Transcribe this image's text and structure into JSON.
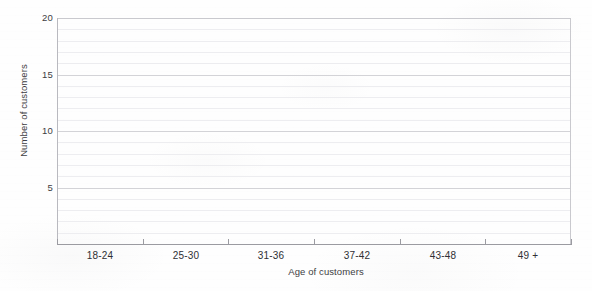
{
  "chart_data": {
    "type": "bar",
    "title": "",
    "subtitle": "",
    "xlabel": "Age of customers",
    "ylabel": "Number of customers",
    "categories": [
      "18-24",
      "25-30",
      "31-36",
      "37-42",
      "43-48",
      "49 +"
    ],
    "values": [
      0,
      0,
      0,
      0,
      0,
      0
    ],
    "series": [
      {
        "name": "Number of customers",
        "values": [
          0,
          0,
          0,
          0,
          0,
          0
        ]
      }
    ],
    "ylim": [
      0,
      20
    ],
    "xlim": [
      0,
      6
    ],
    "y_ticks": [
      5,
      10,
      15,
      20
    ],
    "y_tick_labels": [
      "5",
      "10",
      "15",
      "20"
    ],
    "y_minor_tick_step": 1,
    "x_tick_labels": [
      "18-24",
      "25-30",
      "31-36",
      "37-42",
      "43-48",
      "49 +"
    ],
    "grid": "horizontal",
    "legend": "none",
    "annotations": []
  },
  "axes": {
    "y": {
      "title": "Number of customers",
      "ticks": [
        {
          "label": "20",
          "value": 20
        },
        {
          "label": "15",
          "value": 15
        },
        {
          "label": "10",
          "value": 10
        },
        {
          "label": "5",
          "value": 5
        }
      ]
    },
    "x": {
      "title": "Age of customers",
      "ticks": [
        {
          "label": "18-24"
        },
        {
          "label": "25-30"
        },
        {
          "label": "31-36"
        },
        {
          "label": "37-42"
        },
        {
          "label": "43-48"
        },
        {
          "label": "49 +"
        }
      ]
    }
  },
  "colors": {
    "background": "#fefefe",
    "gridline_minor": "#ededf0",
    "gridline_major": "#d3d3d7",
    "axis_line": "#9b9ba1",
    "text": "#2f2f34",
    "axis_title_text": "#3d3d42"
  }
}
